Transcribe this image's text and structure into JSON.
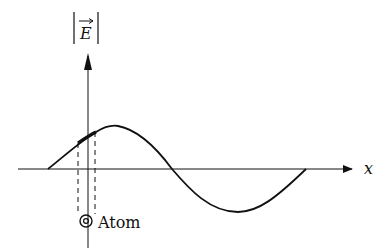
{
  "diagram": {
    "y_axis_label": "E",
    "y_axis_label_decor": "|vec|",
    "x_axis_label": "x",
    "atom_label": "Atom",
    "atom_symbol": "out-of-page circle-dot",
    "curve": "sinusoid, one full period, starting above axis",
    "highlight": "bold segment of curve between dashed lines over atom position",
    "colors": {
      "stroke": "#111111",
      "background": "#ffffff"
    }
  }
}
